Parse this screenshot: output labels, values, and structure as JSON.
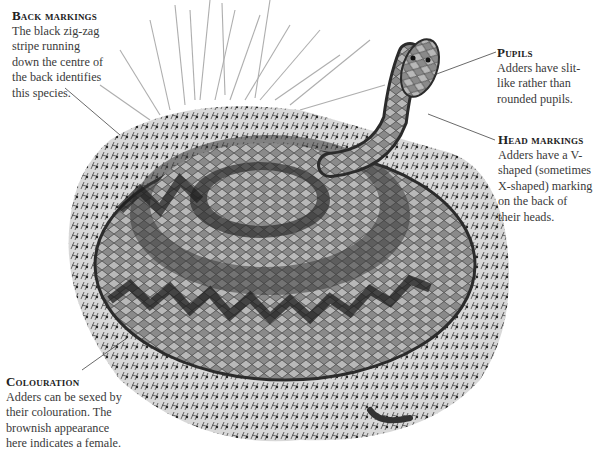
{
  "callouts": {
    "back_markings": {
      "title": "Back markings",
      "body": "The black zig-zag\nstripe running\ndown the centre of\nthe back identifies\nthis species."
    },
    "pupils": {
      "title": "Pupils",
      "body": "Adders have slit-\nlike rather than\nrounded pupils."
    },
    "head_markings": {
      "title": "Head markings",
      "body": "Adders have a V-\nshaped (sometimes\nX-shaped) marking\non the back of\ntheir heads."
    },
    "colouration": {
      "title": "Colouration",
      "body": "Adders can be sexed by\ntheir colouration. The\nbrownish appearance\nhere indicates a female."
    }
  },
  "illustration": {
    "subject": "coiled adder snake on grass tussock",
    "colors": {
      "background": "#ffffff",
      "text": "#3a3a3a",
      "snake_dark": "#2b2b2b",
      "snake_light": "#9a9a9a",
      "grass": "#b5b5b5"
    }
  }
}
